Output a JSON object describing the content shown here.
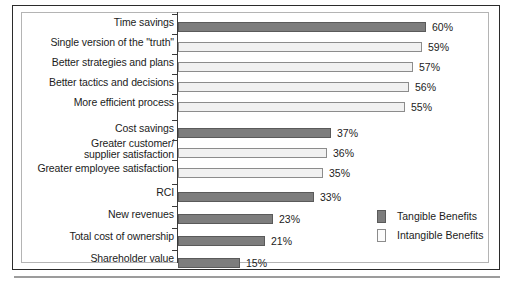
{
  "chart_data": {
    "type": "bar",
    "orientation": "horizontal",
    "title": "",
    "subtitle": "",
    "xlabel": "",
    "ylabel": "",
    "xlim": [
      0,
      60
    ],
    "grid": false,
    "value_suffix": "%",
    "legend_position": "bottom-right",
    "categories": [
      "Time savings",
      "Single version of the \"truth\"",
      "Better strategies and plans",
      "Better tactics and decisions",
      "More efficient process",
      "Cost savings",
      "Greater customer/\nsupplier satisfaction",
      "Greater employee satisfaction",
      "RCI",
      "New revenues",
      "Total cost of ownership",
      "Shareholder value"
    ],
    "values": [
      60,
      59,
      57,
      56,
      55,
      37,
      36,
      35,
      33,
      23,
      21,
      15
    ],
    "value_labels": [
      "60%",
      "59%",
      "57%",
      "56%",
      "55%",
      "37%",
      "36%",
      "35%",
      "33%",
      "23%",
      "21%",
      "15%"
    ],
    "series_of_bar": [
      "tangible",
      "intangible",
      "intangible",
      "intangible",
      "intangible",
      "tangible",
      "intangible",
      "intangible",
      "tangible",
      "tangible",
      "tangible",
      "tangible"
    ],
    "series": [
      {
        "name": "Tangible Benefits",
        "key": "tangible",
        "color": "#7d7d7d"
      },
      {
        "name": "Intangible Benefits",
        "key": "intangible",
        "color": "#f1f1f1"
      }
    ],
    "legend": [
      {
        "label": "Tangible Benefits",
        "key": "tangible"
      },
      {
        "label": "Intangible Benefits",
        "key": "intangible"
      }
    ]
  }
}
